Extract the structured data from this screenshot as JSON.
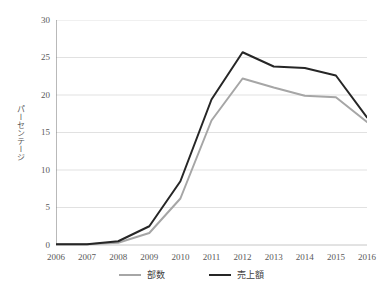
{
  "chart_data": {
    "type": "line",
    "title": "",
    "xlabel": "",
    "ylabel": "パーセンテージ",
    "categories": [
      "2006",
      "2007",
      "2008",
      "2009",
      "2010",
      "2011",
      "2012",
      "2013",
      "2014",
      "2015",
      "2016"
    ],
    "ylim": [
      0,
      30
    ],
    "yticks": [
      0,
      5,
      10,
      15,
      20,
      25,
      30
    ],
    "grid": true,
    "legend_position": "bottom",
    "series": [
      {
        "name": "部数",
        "color": "#a6a6a6",
        "values": [
          0.1,
          0.1,
          0.3,
          1.6,
          6.2,
          16.6,
          22.2,
          21.0,
          19.9,
          19.7,
          16.4
        ]
      },
      {
        "name": "売上額",
        "color": "#262626",
        "values": [
          0.1,
          0.1,
          0.5,
          2.5,
          8.5,
          19.4,
          25.7,
          23.8,
          23.6,
          22.6,
          17.0
        ]
      }
    ]
  },
  "axis": {
    "y_tick_labels": [
      "0",
      "5",
      "10",
      "15",
      "20",
      "25",
      "30"
    ],
    "x_tick_labels": [
      "2006",
      "2007",
      "2008",
      "2009",
      "2010",
      "2011",
      "2012",
      "2013",
      "2014",
      "2015",
      "2016"
    ],
    "y_axis_title": "パーセンテージ"
  },
  "legend": {
    "items": [
      {
        "label": "部数",
        "color": "#a6a6a6"
      },
      {
        "label": "売上額",
        "color": "#262626"
      }
    ]
  }
}
